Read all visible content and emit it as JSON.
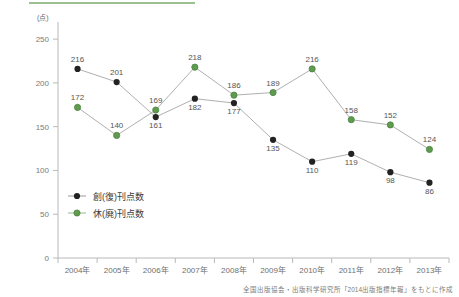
{
  "accent": {
    "bar_color": "#7aab6a"
  },
  "axis": {
    "y_unit": "(点)",
    "y_ticks": [
      "0",
      "50",
      "100",
      "150",
      "200",
      "250"
    ],
    "x_ticks": [
      "2004年",
      "2005年",
      "2006年",
      "2007年",
      "2008年",
      "2009年",
      "2010年",
      "2011年",
      "2012年",
      "2013年"
    ]
  },
  "legend": {
    "items": [
      {
        "label": "創(復)刊点数",
        "color": "#222222"
      },
      {
        "label": "休(廃)刊点数",
        "color": "#5f9b4f"
      }
    ]
  },
  "footer": {
    "source": "全国出版協会・出版科学研究所「2014出版指標年報」をもとに作成"
  },
  "chart_data": {
    "type": "line",
    "title": "",
    "xlabel": "",
    "ylabel": "(点)",
    "ylim": [
      0,
      265
    ],
    "grid": false,
    "legend_position": "inside-left-lower",
    "categories": [
      "2004年",
      "2005年",
      "2006年",
      "2007年",
      "2008年",
      "2009年",
      "2010年",
      "2011年",
      "2012年",
      "2013年"
    ],
    "series": [
      {
        "name": "創(復)刊点数",
        "color": "#222222",
        "values": [
          216,
          201,
          161,
          182,
          177,
          135,
          110,
          119,
          98,
          86
        ],
        "label_positions": [
          "above",
          "above",
          "below",
          "below",
          "below",
          "below",
          "below",
          "below",
          "below",
          "below"
        ]
      },
      {
        "name": "休(廃)刊点数",
        "color": "#5f9b4f",
        "values": [
          172,
          140,
          169,
          218,
          186,
          189,
          216,
          158,
          152,
          124
        ],
        "label_positions": [
          "above",
          "above",
          "above",
          "above",
          "above",
          "above",
          "above",
          "above",
          "above",
          "above"
        ]
      }
    ]
  }
}
